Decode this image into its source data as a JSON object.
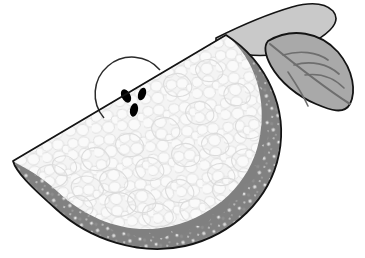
{
  "artwork": {
    "title": "Melon Slice with Leaf",
    "subject": "watermelon-slice",
    "style": "grayscale-clipart",
    "canvas": {
      "width": 365,
      "height": 258,
      "background": "#ffffff"
    }
  },
  "palette": {
    "background": "#ffffff",
    "outline": "#1a1a1a",
    "rind": "#808080",
    "rind_speckle": "#ffffff",
    "flesh": "#f2f2f2",
    "flesh_cell_stroke": "#dcdcdc",
    "core_outline": "#2b2b2b",
    "seed": "#000000",
    "leaf_body": "#a9a9a9",
    "leaf_vein": "#6e6e6e",
    "stem_body": "#c9c9c9",
    "stem_outline": "#1a1a1a"
  },
  "parts": [
    {
      "id": "wedge",
      "label": "Melon wedge",
      "description": "Half-circle slice with straight cut edge on top-left and curved rind on bottom-right"
    },
    {
      "id": "rind",
      "label": "Rind band",
      "description": "Medium gray band with bumpy inner edge and white speckles"
    },
    {
      "id": "flesh",
      "label": "Flesh",
      "description": "Near-white area filled with pebble/cell texture"
    },
    {
      "id": "core",
      "label": "Seed core",
      "description": "Half-circle outline near the top cut edge containing the seeds"
    },
    {
      "id": "seeds",
      "label": "Seeds",
      "description": "Three black oval seeds"
    },
    {
      "id": "leaf",
      "label": "Leaf",
      "description": "Pointed gray leaf at the upper right with a midrib and branching veins"
    },
    {
      "id": "stem",
      "label": "Stem blade",
      "description": "Light gray tapered shape angling up to the right above the leaf"
    }
  ],
  "geometry": {
    "cut_edge": {
      "x1": 13,
      "y1": 161,
      "x2": 226,
      "y2": 35
    },
    "wedge_tip_left": {
      "x": 13,
      "y": 161
    },
    "wedge_corner_right": {
      "x": 226,
      "y": 35
    },
    "wedge_bottom": {
      "x": 185,
      "y": 246
    },
    "core": {
      "cx": 133,
      "cy": 92,
      "r": 31
    },
    "seed_count": 3,
    "leaf_tip": {
      "x": 352,
      "y": 102
    },
    "stem_tip": {
      "x": 333,
      "y": 30
    }
  },
  "seeds": [
    {
      "cx": 126,
      "cy": 96,
      "rx": 4.4,
      "ry": 7.2,
      "rotate": -28
    },
    {
      "cx": 142,
      "cy": 94,
      "rx": 3.8,
      "ry": 6.6,
      "rotate": 20
    },
    {
      "cx": 134,
      "cy": 110,
      "rx": 4.0,
      "ry": 6.8,
      "rotate": 12
    }
  ],
  "leaf_veins": [
    {
      "name": "midrib"
    },
    {
      "name": "vein-upper-left"
    },
    {
      "name": "vein-mid-left"
    },
    {
      "name": "vein-lower-left"
    },
    {
      "name": "vein-bottom-left"
    }
  ]
}
